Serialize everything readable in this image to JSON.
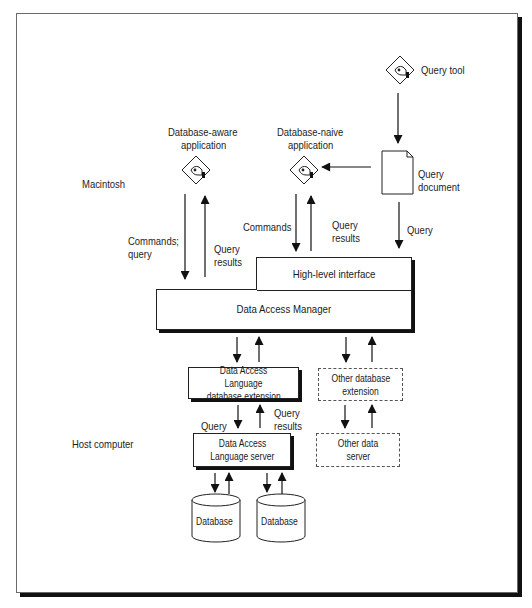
{
  "diagram": {
    "regions": {
      "macintosh": "Macintosh",
      "host": "Host computer"
    },
    "nodes": {
      "query_tool": "Query tool",
      "query_document": [
        "Query",
        "document"
      ],
      "db_aware_app": [
        "Database-aware",
        "application"
      ],
      "db_naive_app": [
        "Database-naive",
        "application"
      ],
      "high_level_interface": "High-level interface",
      "data_access_manager": "Data Access Manager",
      "dal_extension": [
        "Data Access Language",
        "database extension"
      ],
      "other_db_extension": [
        "Other database",
        "extension"
      ],
      "dal_server": [
        "Data Access",
        "Language server"
      ],
      "other_data_server": [
        "Other data",
        "server"
      ],
      "database_1": "Database",
      "database_2": "Database"
    },
    "edge_labels": {
      "commands_query": [
        "Commands;",
        "query"
      ],
      "query_results_left": [
        "Query",
        "results"
      ],
      "commands": "Commands",
      "query_results_mid": [
        "Query",
        "results"
      ],
      "query_right": "Query",
      "query_lower": "Query",
      "query_results_lower": [
        "Query",
        "results"
      ]
    },
    "colors": {
      "ink": "#1a1a1a",
      "frame": "#6a6a6a",
      "shadow": "#111111",
      "background": "#ffffff"
    }
  }
}
